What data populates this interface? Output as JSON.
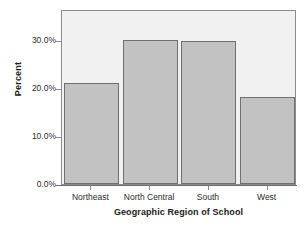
{
  "chart_data": {
    "type": "bar",
    "title": "",
    "subtitle": "",
    "xlabel": "Geographic Region of School",
    "ylabel": "Percent",
    "categories": [
      "Northeast",
      "North Central",
      "South",
      "West"
    ],
    "values": [
      21.0,
      30.0,
      29.8,
      18.2
    ],
    "value_labels": [
      "21.0%",
      "30.0%",
      "29.8%",
      "18.2%"
    ],
    "ylim": [
      0.0,
      36.5
    ],
    "ytick_values": [
      0.0,
      10.0,
      20.0,
      30.0
    ],
    "ytick_labels": [
      "0.0%",
      "10.0%",
      "20.0%",
      "30.0%"
    ],
    "grid": false,
    "legend": false,
    "legend_position": "none",
    "series": [
      {
        "name": "Percent",
        "values": [
          21.0,
          30.0,
          29.8,
          18.2
        ]
      }
    ],
    "colors": {
      "bar_fill": "#c2c2c2",
      "bar_border": "#6f6f6f",
      "plot_background": "#f1f1f1",
      "frame_border": "#8d8d8d",
      "axis": "#6f6f6f",
      "text": "#2b2b2b",
      "title_text": "#1a1a1a",
      "page_background": "#ffffff"
    }
  }
}
